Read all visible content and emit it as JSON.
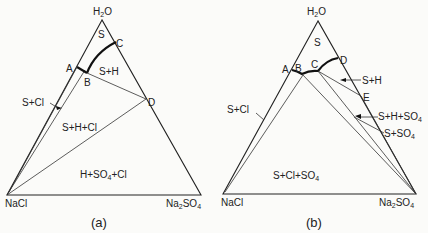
{
  "panels": [
    {
      "id": "a",
      "caption": "(a)",
      "vertices": {
        "top": "H2O",
        "left": "NaCl",
        "right": "Na2SO4"
      },
      "points": [
        "A",
        "B",
        "C",
        "D"
      ],
      "regions": [
        "S",
        "S+H",
        "S+Cl",
        "S+H+Cl",
        "H+SO4+Cl"
      ]
    },
    {
      "id": "b",
      "caption": "(b)",
      "vertices": {
        "top": "H2O",
        "left": "NaCl",
        "right": "Na2SO4"
      },
      "points": [
        "A",
        "B",
        "C",
        "D",
        "E"
      ],
      "regions": [
        "S",
        "S+H",
        "S+Cl",
        "S+H+SO4",
        "S+SO4",
        "S+Cl+SO4"
      ]
    }
  ],
  "labels": {
    "h2o_main": "H",
    "h2o_sub": "2",
    "h2o_end": "O",
    "nacl": "NaCl",
    "na": "Na",
    "na_sub": "2",
    "so4": "SO",
    "so4_sub": "4",
    "S": "S",
    "SH": "S+H",
    "SCl": "S+Cl",
    "SHCl": "S+H+Cl",
    "HSO4Cl_a": "H+SO",
    "HSO4Cl_b": "+Cl",
    "SHSO4": "S+H+SO",
    "SSO4": "S+SO",
    "SClSO4_a": "S+Cl+SO",
    "A": "A",
    "B": "B",
    "C": "C",
    "D": "D",
    "E": "E",
    "cap_a": "(a)",
    "cap_b": "(b)"
  }
}
